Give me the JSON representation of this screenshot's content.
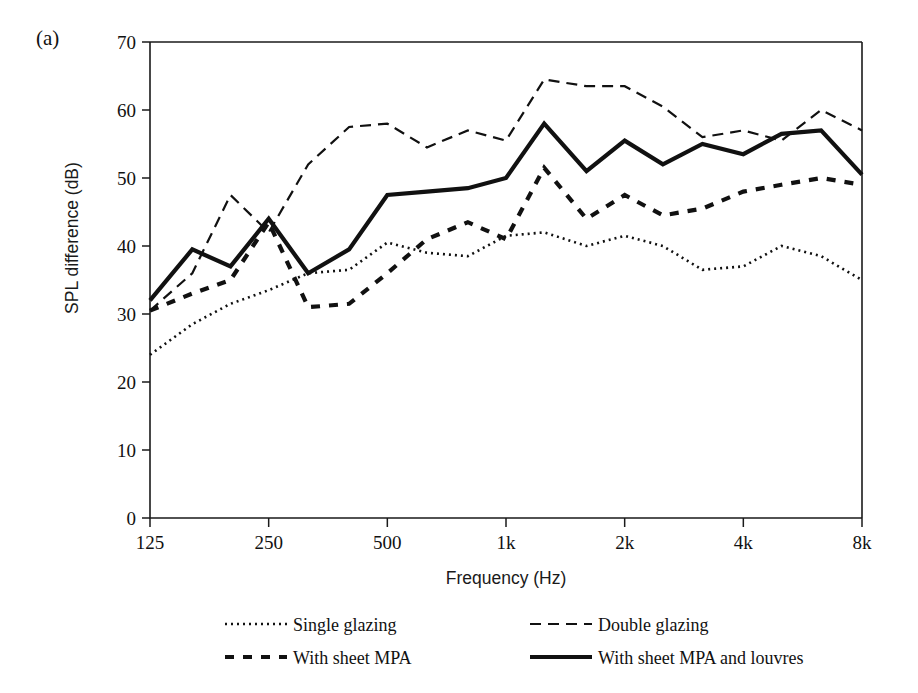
{
  "figure": {
    "panel_label": "(a)"
  },
  "chart_data": {
    "type": "line",
    "title": "",
    "xlabel": "Frequency (Hz)",
    "ylabel": "SPL difference (dB)",
    "ylim": [
      0,
      70
    ],
    "ytick_values": [
      0,
      10,
      20,
      30,
      40,
      50,
      60,
      70
    ],
    "ytick_labels": [
      "0",
      "10",
      "20",
      "30",
      "40",
      "50",
      "60",
      "70"
    ],
    "xtick_labels": [
      "125",
      "250",
      "500",
      "1k",
      "2k",
      "4k",
      "8k"
    ],
    "xtick_values": [
      125,
      250,
      500,
      1000,
      2000,
      4000,
      8000
    ],
    "x": [
      125,
      160,
      200,
      250,
      315,
      400,
      500,
      630,
      800,
      1000,
      1250,
      1600,
      2000,
      2500,
      3150,
      4000,
      5000,
      6300,
      8000
    ],
    "x_labels": [
      "125",
      "160",
      "200",
      "250",
      "315",
      "400",
      "500",
      "630",
      "800",
      "1k",
      "1.25k",
      "1.6k",
      "2k",
      "2.5k",
      "3.15k",
      "4k",
      "5k",
      "6.3k",
      "8k"
    ],
    "grid": false,
    "legend_position": "below",
    "series": [
      {
        "name": "Single glazing",
        "dash": "dotted",
        "line_style": "2,4",
        "line_width": 2.6,
        "color": "#111111",
        "values": [
          24,
          28.5,
          31.5,
          33.5,
          36,
          36.5,
          40.5,
          39,
          38.5,
          41.5,
          42,
          40,
          41.5,
          40,
          36.5,
          37,
          40,
          38.5,
          35
        ]
      },
      {
        "name": "Double glazing",
        "dash": "dashed",
        "line_style": "11,7",
        "line_width": 2.2,
        "color": "#111111",
        "values": [
          30.5,
          36,
          47.5,
          42,
          52,
          57.5,
          58,
          54.5,
          57,
          55.5,
          64.5,
          63.5,
          63.5,
          60.5,
          56,
          57,
          55.5,
          60,
          57
        ]
      },
      {
        "name": "With sheet MPA",
        "dash": "dashed-thick",
        "line_style": "9,9",
        "line_width": 4.2,
        "color": "#111111",
        "values": [
          30.5,
          33,
          35,
          43.5,
          31,
          31.5,
          36,
          41,
          43.5,
          41,
          51.5,
          44,
          47.5,
          44.5,
          45.5,
          48,
          49,
          50,
          49
        ]
      },
      {
        "name": "With sheet MPA and louvres",
        "dash": "solid",
        "line_style": "",
        "line_width": 4.2,
        "color": "#111111",
        "values": [
          32,
          39.5,
          37,
          44,
          36,
          39.5,
          47.5,
          48,
          48.5,
          50,
          58,
          51,
          55.5,
          52,
          55,
          53.5,
          56.5,
          57,
          50.5
        ]
      }
    ]
  },
  "legend": {
    "entries": [
      {
        "label": "Single glazing",
        "style": "dotted"
      },
      {
        "label": "Double glazing",
        "style": "dashed"
      },
      {
        "label": "With sheet MPA",
        "style": "dashed-thick"
      },
      {
        "label": "With sheet MPA and louvres",
        "style": "solid"
      }
    ]
  }
}
